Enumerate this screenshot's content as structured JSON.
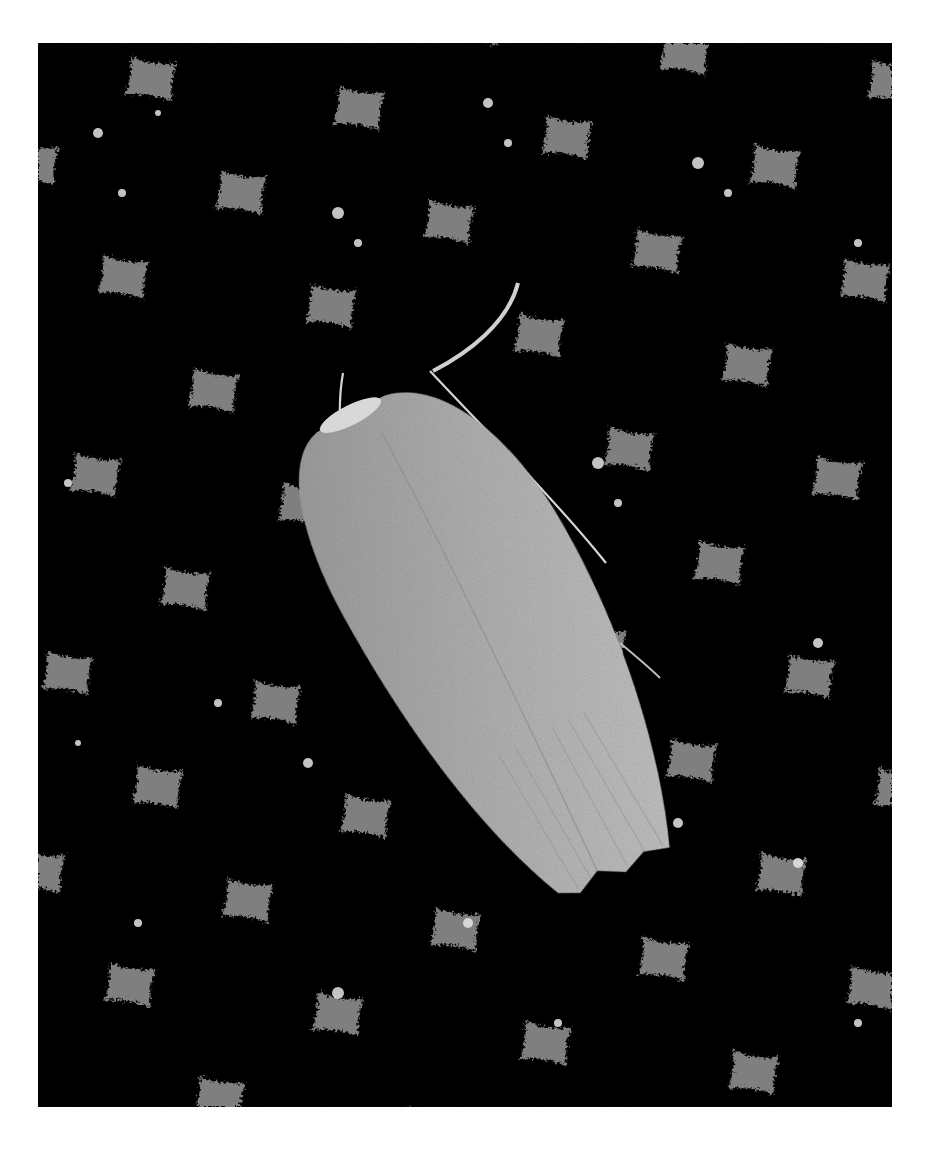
{
  "photo": {
    "subject": "moth resting on honeycomb",
    "style": "black and white photograph",
    "colors": {
      "background": "#ffffff",
      "cells": "#050505",
      "comb_walls": "#9a9a9a",
      "comb_highlight": "#e8e8e8",
      "moth_body": "#a8a8a8",
      "moth_highlight": "#cfcfcf"
    },
    "frame": {
      "x": 38,
      "y": 43,
      "width": 854,
      "height": 1064
    }
  }
}
